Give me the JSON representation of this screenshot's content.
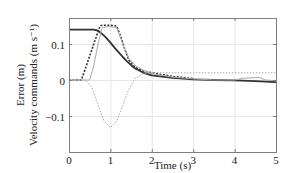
{
  "chart_data": {
    "type": "line",
    "title": "",
    "xlabel": "Time (s)",
    "ylabel_lines": [
      "Error (m)",
      "Velocity commands (m s⁻¹)"
    ],
    "xlim": [
      0,
      5
    ],
    "ylim": [
      -0.15,
      0.175
    ],
    "xticks": [
      0,
      1,
      2,
      3,
      4,
      5
    ],
    "xtick_labels": [
      "0",
      "1",
      "2",
      "3",
      "4",
      "5"
    ],
    "yticks": [
      -0.1,
      0,
      0.1
    ],
    "ytick_labels": [
      "−0.1",
      "0",
      "0.1"
    ],
    "grid": true,
    "legend": null,
    "series": [
      {
        "name": "error",
        "style": "solid",
        "color": "#333333",
        "width": 1.8,
        "x": [
          0,
          0.3,
          0.6,
          0.7,
          0.8,
          0.9,
          1.0,
          1.1,
          1.2,
          1.3,
          1.4,
          1.5,
          1.6,
          1.8,
          2.0,
          2.5,
          3.0,
          3.5,
          4.0,
          4.5,
          5.0
        ],
        "y": [
          0.14,
          0.14,
          0.14,
          0.137,
          0.128,
          0.117,
          0.104,
          0.09,
          0.077,
          0.064,
          0.052,
          0.041,
          0.032,
          0.02,
          0.013,
          0.006,
          0.002,
          0.0,
          -0.001,
          -0.003,
          -0.006
        ]
      },
      {
        "name": "velocity-command",
        "style": "dotted",
        "color": "#333333",
        "width": 1.6,
        "x": [
          0,
          0.3,
          0.45,
          0.6,
          0.75,
          0.8,
          1.0,
          1.15,
          1.25,
          1.35,
          1.45,
          1.55,
          1.65,
          1.8,
          2.0,
          2.5,
          3.0
        ],
        "y": [
          0.0,
          0.0,
          0.05,
          0.1,
          0.15,
          0.152,
          0.152,
          0.15,
          0.12,
          0.085,
          0.055,
          0.04,
          0.032,
          0.025,
          0.02,
          0.01,
          0.004
        ]
      },
      {
        "name": "velocity-actual",
        "style": "solid",
        "color": "#aaaaaa",
        "width": 1.0,
        "x": [
          0,
          0.5,
          0.6,
          0.7,
          0.8,
          0.9,
          1.0,
          1.15,
          1.3,
          1.45,
          1.6,
          1.8,
          2.0,
          2.5,
          3.0,
          3.5,
          4.0,
          4.2,
          4.6,
          4.75,
          5.0
        ],
        "y": [
          0.0,
          0.0,
          0.04,
          0.1,
          0.145,
          0.148,
          0.148,
          0.146,
          0.1,
          0.06,
          0.04,
          0.027,
          0.018,
          0.008,
          0.003,
          0.0,
          0.0,
          0.005,
          0.007,
          0.0,
          -0.002
        ]
      },
      {
        "name": "velocity-other",
        "style": "dotted",
        "color": "#aaaaaa",
        "width": 1.0,
        "x": [
          0,
          0.4,
          0.55,
          0.7,
          0.85,
          1.0,
          1.15,
          1.3,
          1.45,
          1.6,
          1.8,
          2.0,
          5.0
        ],
        "y": [
          0.0,
          0.0,
          -0.02,
          -0.07,
          -0.115,
          -0.132,
          -0.115,
          -0.07,
          -0.025,
          0.005,
          0.018,
          0.02,
          0.02
        ]
      }
    ]
  },
  "plot": {
    "frame": {
      "left": 69,
      "right": 276,
      "top": 18,
      "bottom": 152
    },
    "grid_color": "#e6e6e6",
    "frame_color": "#7f7f7f"
  }
}
